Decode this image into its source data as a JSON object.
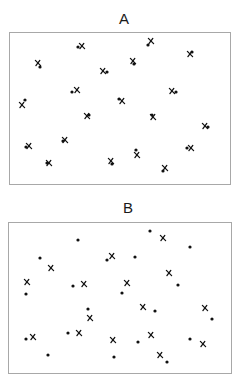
{
  "figure": {
    "panels": [
      {
        "label": "A",
        "description": "Dots and crosses closely paired (co-located)",
        "box": {
          "left": 9,
          "top": 32,
          "right": 230,
          "bottom": 184
        },
        "label_pos": {
          "x": 124,
          "y": 11
        },
        "dots": [
          [
            78,
            47
          ],
          [
            40,
            67
          ],
          [
            107,
            72
          ],
          [
            134,
            64
          ],
          [
            148,
            45
          ],
          [
            192,
            52
          ],
          [
            72,
            92
          ],
          [
            176,
            92
          ],
          [
            25,
            100
          ],
          [
            119,
            99
          ],
          [
            89,
            115
          ],
          [
            152,
            115
          ],
          [
            208,
            127
          ],
          [
            26,
            147
          ],
          [
            63,
            141
          ],
          [
            136,
            150
          ],
          [
            187,
            148
          ],
          [
            47,
            163
          ],
          [
            112,
            164
          ],
          [
            163,
            171
          ]
        ],
        "crosses": [
          [
            82,
            46
          ],
          [
            38,
            63
          ],
          [
            103,
            71
          ],
          [
            133,
            61
          ],
          [
            151,
            41
          ],
          [
            190,
            54
          ],
          [
            77,
            90
          ],
          [
            172,
            91
          ],
          [
            22,
            105
          ],
          [
            122,
            101
          ],
          [
            87,
            116
          ],
          [
            153,
            117
          ],
          [
            205,
            126
          ],
          [
            29,
            146
          ],
          [
            65,
            140
          ],
          [
            137,
            155
          ],
          [
            191,
            148
          ],
          [
            49,
            163
          ],
          [
            111,
            161
          ],
          [
            165,
            168
          ]
        ]
      },
      {
        "label": "B",
        "description": "Dots and crosses randomly scattered (independent)",
        "box": {
          "left": 8,
          "top": 222,
          "right": 231,
          "bottom": 373
        },
        "label_pos": {
          "x": 128,
          "y": 200
        },
        "dots": [
          [
            150,
            231
          ],
          [
            78,
            240
          ],
          [
            190,
            247
          ],
          [
            40,
            258
          ],
          [
            107,
            260
          ],
          [
            135,
            257
          ],
          [
            26,
            294
          ],
          [
            73,
            286
          ],
          [
            122,
            293
          ],
          [
            178,
            285
          ],
          [
            88,
            309
          ],
          [
            155,
            311
          ],
          [
            212,
            319
          ],
          [
            26,
            339
          ],
          [
            68,
            333
          ],
          [
            138,
            342
          ],
          [
            190,
            339
          ],
          [
            48,
            355
          ],
          [
            114,
            357
          ],
          [
            167,
            362
          ]
        ],
        "crosses": [
          [
            163,
            238
          ],
          [
            112,
            256
          ],
          [
            51,
            268
          ],
          [
            169,
            273
          ],
          [
            27,
            282
          ],
          [
            84,
            284
          ],
          [
            127,
            283
          ],
          [
            143,
            307
          ],
          [
            205,
            308
          ],
          [
            90,
            318
          ],
          [
            33,
            337
          ],
          [
            79,
            333
          ],
          [
            113,
            340
          ],
          [
            151,
            335
          ],
          [
            203,
            344
          ],
          [
            160,
            355
          ]
        ]
      }
    ],
    "legend": {
      "dot": "filled-circle-marker",
      "cross": "x-marker"
    },
    "colors": {
      "marker": "#111111",
      "border": "#a8a8a8",
      "background": "#ffffff"
    }
  }
}
